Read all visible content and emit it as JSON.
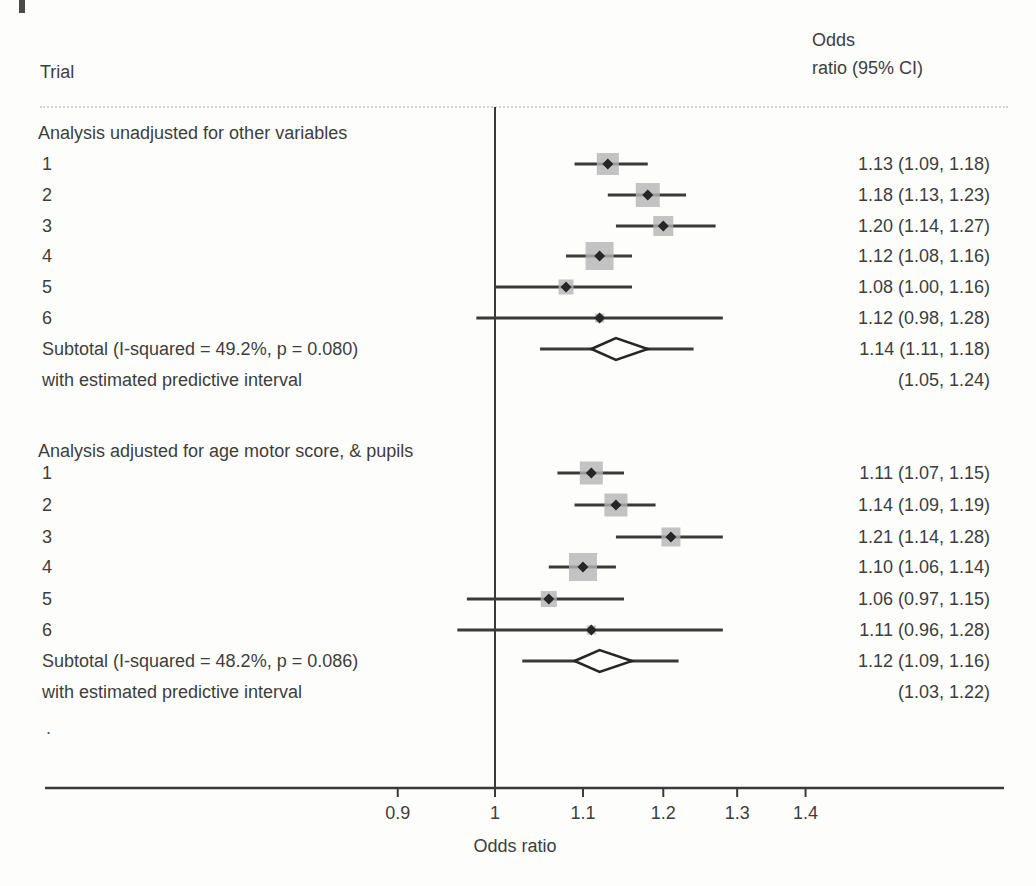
{
  "page": {
    "stray_dot": "."
  },
  "header": {
    "trial_label": "Trial",
    "or_col_line1": "Odds",
    "or_col_line2": "ratio (95% CI)"
  },
  "x_axis": {
    "label": "Odds ratio",
    "tick_labels": [
      "0.9",
      "1",
      "1.1",
      "1.2",
      "1.3",
      "1.4"
    ]
  },
  "chart_data": {
    "type": "forest",
    "x_scale": "log",
    "xlabel": "Odds ratio",
    "x_ticks": [
      0.9,
      1,
      1.1,
      1.2,
      1.3,
      1.4
    ],
    "reference_line": 1,
    "or_column_header": "Odds ratio (95% CI)",
    "sections": [
      {
        "title": "Analysis unadjusted for other variables",
        "studies": [
          {
            "trial": "1",
            "or": 1.13,
            "ci_low": 1.09,
            "ci_high": 1.18,
            "display": "1.13 (1.09, 1.18)",
            "box": 22
          },
          {
            "trial": "2",
            "or": 1.18,
            "ci_low": 1.13,
            "ci_high": 1.23,
            "display": "1.18 (1.13, 1.23)",
            "box": 24
          },
          {
            "trial": "3",
            "or": 1.2,
            "ci_low": 1.14,
            "ci_high": 1.27,
            "display": "1.20 (1.14, 1.27)",
            "box": 20
          },
          {
            "trial": "4",
            "or": 1.12,
            "ci_low": 1.08,
            "ci_high": 1.16,
            "display": "1.12 (1.08, 1.16)",
            "box": 28
          },
          {
            "trial": "5",
            "or": 1.08,
            "ci_low": 1.0,
            "ci_high": 1.16,
            "display": "1.08 (1.00, 1.16)",
            "box": 15
          },
          {
            "trial": "6",
            "or": 1.12,
            "ci_low": 0.98,
            "ci_high": 1.28,
            "display": "1.12 (0.98, 1.28)",
            "box": 9
          }
        ],
        "subtotal": {
          "label": "Subtotal (I-squared = 49.2%, p = 0.080)",
          "or": 1.14,
          "ci_low": 1.11,
          "ci_high": 1.18,
          "display": "1.14 (1.11, 1.18)"
        },
        "predictive": {
          "label": "with estimated predictive interval",
          "low": 1.05,
          "high": 1.24,
          "display": "(1.05, 1.24)"
        }
      },
      {
        "title": "Analysis adjusted for age motor score, & pupils",
        "studies": [
          {
            "trial": "1",
            "or": 1.11,
            "ci_low": 1.07,
            "ci_high": 1.15,
            "display": "1.11 (1.07, 1.15)",
            "box": 23
          },
          {
            "trial": "2",
            "or": 1.14,
            "ci_low": 1.09,
            "ci_high": 1.19,
            "display": "1.14 (1.09, 1.19)",
            "box": 23
          },
          {
            "trial": "3",
            "or": 1.21,
            "ci_low": 1.14,
            "ci_high": 1.28,
            "display": "1.21 (1.14, 1.28)",
            "box": 19
          },
          {
            "trial": "4",
            "or": 1.1,
            "ci_low": 1.06,
            "ci_high": 1.14,
            "display": "1.10 (1.06, 1.14)",
            "box": 28
          },
          {
            "trial": "5",
            "or": 1.06,
            "ci_low": 0.97,
            "ci_high": 1.15,
            "display": "1.06 (0.97, 1.15)",
            "box": 16
          },
          {
            "trial": "6",
            "or": 1.11,
            "ci_low": 0.96,
            "ci_high": 1.28,
            "display": "1.11 (0.96, 1.28)",
            "box": 9
          }
        ],
        "subtotal": {
          "label": "Subtotal (I-squared = 48.2%, p = 0.086)",
          "or": 1.12,
          "ci_low": 1.09,
          "ci_high": 1.16,
          "display": "1.12 (1.09, 1.16)"
        },
        "predictive": {
          "label": "with estimated predictive interval",
          "low": 1.03,
          "high": 1.22,
          "display": "(1.03, 1.22)"
        }
      }
    ],
    "colors": {
      "line": "#3a3a3a",
      "box": "#b4b4b4",
      "marker": "#262626",
      "diamond_fill": "#fdfdfc",
      "text": "#3d3d3d",
      "divider": "#c6c6c6"
    }
  }
}
